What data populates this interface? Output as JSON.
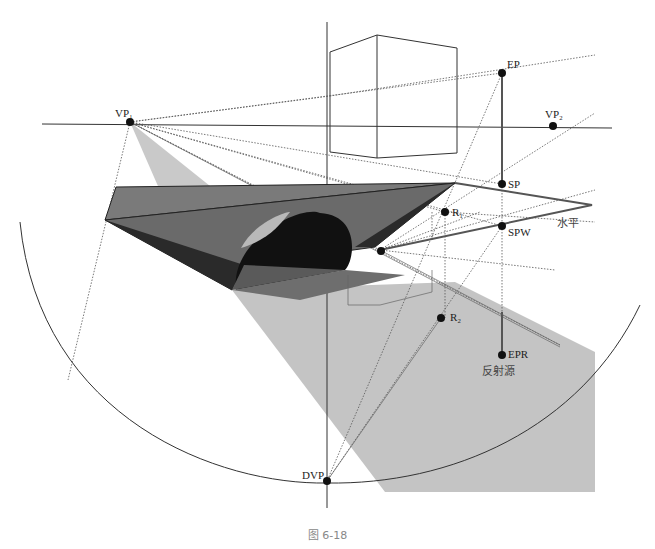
{
  "figure": {
    "caption": "图 6-18",
    "labels": {
      "vp1": "VP₁",
      "vp2": "VP₂",
      "ep": "EP",
      "sp": "SP",
      "spw": "SPW",
      "r1": "R₁",
      "r2": "R₂",
      "epr": "EPR",
      "dvp": "DVP",
      "horizontal": "水平",
      "reflection_source": "反射源"
    },
    "colors": {
      "light_gray": "#c4c4c4",
      "mid_gray": "#7a7a7a",
      "dark_gray": "#4a4a4a",
      "black": "#111111",
      "line": "#333333",
      "magenta_thin": "#888888"
    },
    "points": {
      "VP1": [
        130,
        122
      ],
      "VP2": [
        553,
        126
      ],
      "EP": [
        502,
        73
      ],
      "SP": [
        502,
        184
      ],
      "SPW": [
        502,
        226
      ],
      "R1": [
        445,
        212
      ],
      "R2": [
        441,
        318
      ],
      "EPR": [
        502,
        355
      ],
      "DVP": [
        327,
        481
      ]
    }
  }
}
